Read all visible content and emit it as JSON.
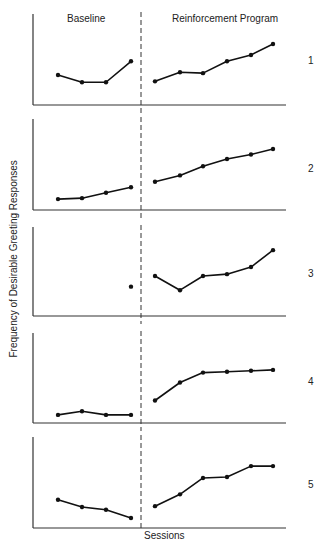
{
  "chart_data": {
    "type": "line",
    "title": "",
    "phase_labels": [
      "Baseline",
      "Reinforcement Program"
    ],
    "xlabel": "Sessions",
    "ylabel": "Frequency of Desirable Greeting Responses",
    "grid": false,
    "legend": null,
    "ylim": [
      0,
      10
    ],
    "phase_change_line": "dashed vertical between session 4 and session 5",
    "panels": [
      {
        "label": "1",
        "baseline": {
          "x": [
            1,
            2,
            3,
            4
          ],
          "y": [
            3.3,
            2.5,
            2.5,
            4.8
          ]
        },
        "treatment": {
          "x": [
            5,
            6,
            7,
            8,
            9,
            10
          ],
          "y": [
            2.6,
            3.6,
            3.5,
            4.8,
            5.5,
            6.7
          ]
        }
      },
      {
        "label": "2",
        "baseline": {
          "x": [
            1,
            2,
            3,
            4
          ],
          "y": [
            1.2,
            1.3,
            1.9,
            2.5
          ]
        },
        "treatment": {
          "x": [
            5,
            6,
            7,
            8,
            9,
            10
          ],
          "y": [
            3.1,
            3.8,
            4.8,
            5.6,
            6.1,
            6.7
          ]
        }
      },
      {
        "label": "3",
        "baseline": {
          "x": [
            4
          ],
          "y": [
            3.3
          ]
        },
        "treatment": {
          "x": [
            5,
            6,
            7,
            8,
            9,
            10
          ],
          "y": [
            4.5,
            2.9,
            4.5,
            4.7,
            5.5,
            7.4
          ]
        }
      },
      {
        "label": "4",
        "baseline": {
          "x": [
            1,
            2,
            3,
            4
          ],
          "y": [
            0.9,
            1.3,
            0.9,
            0.9
          ]
        },
        "treatment": {
          "x": [
            5,
            6,
            7,
            8,
            9,
            10
          ],
          "y": [
            2.5,
            4.5,
            5.6,
            5.7,
            5.8,
            5.9
          ]
        }
      },
      {
        "label": "5",
        "baseline": {
          "x": [
            1,
            2,
            3,
            4
          ],
          "y": [
            3.1,
            2.3,
            2.0,
            1.1
          ]
        },
        "treatment": {
          "x": [
            5,
            6,
            7,
            8,
            9,
            10
          ],
          "y": [
            2.4,
            3.7,
            5.5,
            5.6,
            6.8,
            6.8
          ]
        }
      }
    ]
  },
  "layout": {
    "axis_x_left": 33,
    "axis_x_right": 286,
    "phase_line_x": 141,
    "baseline_session_x": [
      58,
      82,
      106,
      131
    ],
    "treatment_session_x": [
      155,
      180,
      203,
      227,
      251,
      273
    ],
    "panels": [
      {
        "top": 14,
        "bottom": 105
      },
      {
        "top": 119,
        "bottom": 210
      },
      {
        "top": 227,
        "bottom": 316
      },
      {
        "top": 333,
        "bottom": 423
      },
      {
        "top": 437,
        "bottom": 528
      }
    ],
    "line_color": "#111111",
    "axis_color": "#333333"
  }
}
